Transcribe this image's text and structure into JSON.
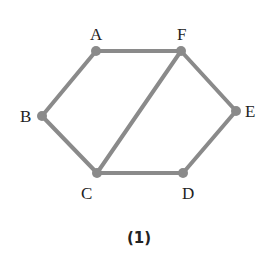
{
  "diagram": {
    "caption": "(1)",
    "edge_color": "#8a8a8a",
    "node_color": "#8a8a8a",
    "nodes": [
      {
        "id": "A",
        "label": "A",
        "x": 96,
        "y": 51
      },
      {
        "id": "F",
        "label": "F",
        "x": 181,
        "y": 51
      },
      {
        "id": "B",
        "label": "B",
        "x": 42,
        "y": 116
      },
      {
        "id": "E",
        "label": "E",
        "x": 236,
        "y": 111
      },
      {
        "id": "C",
        "label": "C",
        "x": 97,
        "y": 173
      },
      {
        "id": "D",
        "label": "D",
        "x": 183,
        "y": 173
      }
    ],
    "edges": [
      [
        "A",
        "F"
      ],
      [
        "A",
        "B"
      ],
      [
        "B",
        "C"
      ],
      [
        "C",
        "F"
      ],
      [
        "F",
        "E"
      ],
      [
        "E",
        "D"
      ],
      [
        "C",
        "D"
      ]
    ]
  }
}
